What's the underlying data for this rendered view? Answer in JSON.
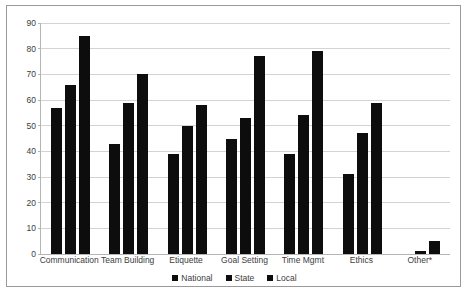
{
  "chart_data": {
    "type": "bar",
    "title": "",
    "xlabel": "",
    "ylabel": "",
    "ylim": [
      0,
      90
    ],
    "ytick_step": 10,
    "yticks": [
      0,
      10,
      20,
      30,
      40,
      50,
      60,
      70,
      80,
      90
    ],
    "grid": true,
    "legend_position": "bottom",
    "categories": [
      "Communication",
      "Team Building",
      "Etiquette",
      "Goal Setting",
      "Time Mgmt",
      "Ethics",
      "Other*"
    ],
    "series": [
      {
        "name": "National",
        "color": "#0d0d0d",
        "values": [
          57,
          43,
          39,
          45,
          39,
          31,
          0
        ]
      },
      {
        "name": "State",
        "color": "#0d0d0d",
        "values": [
          66,
          59,
          50,
          53,
          54,
          47,
          1
        ]
      },
      {
        "name": "Local",
        "color": "#0d0d0d",
        "values": [
          85,
          70,
          58,
          77,
          79,
          59,
          5
        ]
      }
    ]
  },
  "legend": {
    "items": [
      {
        "label": "National",
        "color": "#0d0d0d"
      },
      {
        "label": "State",
        "color": "#0d0d0d"
      },
      {
        "label": "Local",
        "color": "#0d0d0d"
      }
    ]
  },
  "style": {
    "bar_color": "#0d0d0d",
    "gridline_color": "#d3d3d3",
    "axis_color": "#b5b5b5",
    "border_color": "#9a9a9a",
    "background": "#ffffff",
    "text_color": "#3d3d3d"
  }
}
